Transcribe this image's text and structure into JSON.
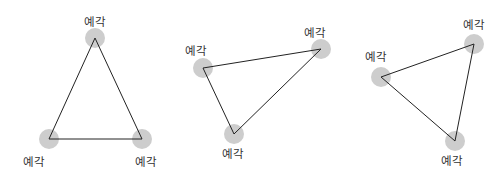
{
  "diagram": {
    "colors": {
      "background": "#ffffff",
      "vertex_marker": "#cdcdcd",
      "edge": "#222222",
      "label": "#333333"
    },
    "triangles": [
      {
        "name": "equilateral-acute-triangle",
        "vertices": [
          {
            "x": 95,
            "y": 38,
            "label": "예각",
            "label_x": 95,
            "label_y": 26
          },
          {
            "x": 49,
            "y": 139,
            "label": "예각",
            "label_x": 34,
            "label_y": 166
          },
          {
            "x": 142,
            "y": 139,
            "label": "예각",
            "label_x": 146,
            "label_y": 166
          }
        ]
      },
      {
        "name": "scalene-acute-triangle-2",
        "vertices": [
          {
            "x": 203,
            "y": 68,
            "label": "예각",
            "label_x": 196,
            "label_y": 55
          },
          {
            "x": 321,
            "y": 49,
            "label": "예각",
            "label_x": 315,
            "label_y": 37
          },
          {
            "x": 234,
            "y": 134,
            "label": "예각",
            "label_x": 233,
            "label_y": 158
          }
        ]
      },
      {
        "name": "scalene-acute-triangle-3",
        "vertices": [
          {
            "x": 381,
            "y": 77,
            "label": "예각",
            "label_x": 376,
            "label_y": 61
          },
          {
            "x": 474,
            "y": 44,
            "label": "예각",
            "label_x": 474,
            "label_y": 29
          },
          {
            "x": 455,
            "y": 141,
            "label": "예각",
            "label_x": 452,
            "label_y": 165
          }
        ]
      }
    ]
  }
}
